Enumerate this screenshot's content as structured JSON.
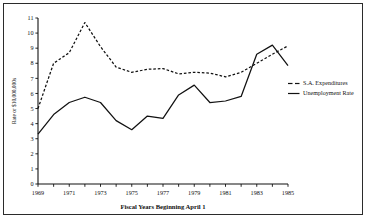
{
  "chart_data": {
    "type": "line",
    "title": "",
    "xlabel": "Fiscal Years Beginning April 1",
    "ylabel": "Rate or $10,000,000s",
    "x": [
      1969,
      1970,
      1971,
      1972,
      1973,
      1974,
      1975,
      1976,
      1977,
      1978,
      1979,
      1980,
      1981,
      1982,
      1983,
      1984,
      1985
    ],
    "xlim": [
      1969,
      1985
    ],
    "ylim": [
      0,
      11
    ],
    "y_ticks": [
      0,
      1,
      2,
      3,
      4,
      5,
      6,
      7,
      8,
      9,
      10,
      11
    ],
    "y_tick_labels": [
      "0",
      "1",
      "2",
      "3",
      "4",
      "5",
      "6",
      "7",
      "8",
      "9",
      "10",
      "11"
    ],
    "x_ticks": [
      1969,
      1970,
      1971,
      1972,
      1973,
      1974,
      1975,
      1976,
      1977,
      1978,
      1979,
      1980,
      1981,
      1982,
      1983,
      1984,
      1985
    ],
    "x_tick_labels": [
      "1969",
      "",
      "1971",
      "",
      "1973",
      "",
      "1975",
      "",
      "1977",
      "",
      "1979",
      "",
      "1981",
      "",
      "1983",
      "",
      "1985"
    ],
    "grid": false,
    "legend_position": "right",
    "series": [
      {
        "name": "S.A. Expenditures",
        "style": "dashed",
        "color": "#111111",
        "values": [
          5.0,
          8.0,
          8.7,
          10.7,
          9.1,
          7.75,
          7.4,
          7.6,
          7.65,
          7.3,
          7.4,
          7.35,
          7.1,
          7.4,
          8.0,
          8.6,
          9.15
        ]
      },
      {
        "name": "Unemployment Rate",
        "style": "solid",
        "color": "#111111",
        "values": [
          3.3,
          4.6,
          5.4,
          5.75,
          5.4,
          4.2,
          3.6,
          4.5,
          4.35,
          5.9,
          6.55,
          5.4,
          5.5,
          5.8,
          8.6,
          9.2,
          7.85
        ]
      }
    ]
  },
  "legend": {
    "entries": [
      {
        "label": "S.A. Expenditures"
      },
      {
        "label": "Unemployment Rate"
      }
    ]
  },
  "axes": {
    "x_title": "Fiscal Years Beginning April 1",
    "y_title": "Rate or $10,000,000s"
  }
}
